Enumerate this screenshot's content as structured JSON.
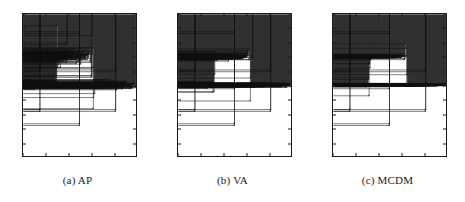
{
  "figure": {
    "background": "#ffffff",
    "ink": "#111111",
    "panel_count": 3
  },
  "panels": [
    {
      "id": "panel-ap",
      "caption": "(a) AP",
      "left": 0,
      "chart_index": 0
    },
    {
      "id": "panel-va",
      "caption": "(b) VA",
      "left": 155,
      "chart_index": 1
    },
    {
      "id": "panel-mcdm",
      "caption": "(c) MCDM",
      "left": 310,
      "chart_index": 2
    }
  ],
  "axis": {
    "x_ticks": [
      0,
      200,
      400,
      600,
      800,
      1000
    ],
    "x_tick_labels": [
      "0",
      "200",
      "400",
      "600",
      "800",
      "1000"
    ],
    "y_ticks": [
      0,
      100,
      200,
      300,
      400,
      500,
      600,
      700,
      800,
      900,
      1000
    ],
    "y_tick_labels": [
      "0",
      "100",
      "200",
      "300",
      "400",
      "500",
      "600",
      "700",
      "800",
      "900",
      "1000"
    ],
    "xlim": [
      0,
      1000
    ],
    "ylim": [
      0,
      1000
    ],
    "grid": false
  },
  "chart_data": [
    {
      "type": "scatter",
      "title": "(a) AP",
      "xlabel": "",
      "ylabel": "",
      "xlim": [
        0,
        1000
      ],
      "ylim": [
        0,
        1000
      ],
      "grid": false,
      "legend": "none",
      "marker": "plus",
      "color": "#111111",
      "noise_level": "high",
      "description": "Step-shaped signal: baseline near 500, elevated plateau near 700 between x=300 and x=620, with heavy scatter at the transitions plus isolated outlier markers.",
      "baseline_value": 500,
      "plateau_value": 700,
      "plateau_range": [
        300,
        620
      ],
      "series": [
        {
          "name": "signal",
          "noise_sigma_baseline": 14,
          "noise_sigma_plateau": 22,
          "noise_sigma_transition": 70,
          "points": 330
        }
      ],
      "outliers": [
        {
          "x": 150,
          "y": 600
        },
        {
          "x": 500,
          "y": 870
        },
        {
          "x": 820,
          "y": 600
        },
        {
          "x": 150,
          "y": 320
        },
        {
          "x": 500,
          "y": 220
        },
        {
          "x": 820,
          "y": 320
        },
        {
          "x": 500,
          "y": 480
        },
        {
          "x": 390,
          "y": 790
        },
        {
          "x": 610,
          "y": 560
        }
      ]
    },
    {
      "type": "scatter",
      "title": "(b) VA",
      "xlabel": "",
      "ylabel": "",
      "xlim": [
        0,
        1000
      ],
      "ylim": [
        0,
        1000
      ],
      "grid": false,
      "legend": "none",
      "marker": "plus",
      "color": "#111111",
      "noise_level": "medium",
      "description": "Step-shaped signal: baseline near 500, plateau near 700 between x=320 and x=640, moderate scatter concentrated at the rising and falling edges.",
      "baseline_value": 500,
      "plateau_value": 700,
      "plateau_range": [
        320,
        640
      ],
      "series": [
        {
          "name": "signal",
          "noise_sigma_baseline": 7,
          "noise_sigma_plateau": 10,
          "noise_sigma_transition": 46,
          "points": 330
        }
      ],
      "outliers": [
        {
          "x": 150,
          "y": 600
        },
        {
          "x": 500,
          "y": 870
        },
        {
          "x": 820,
          "y": 600
        },
        {
          "x": 150,
          "y": 320
        },
        {
          "x": 500,
          "y": 220
        },
        {
          "x": 820,
          "y": 320
        },
        {
          "x": 500,
          "y": 480
        },
        {
          "x": 660,
          "y": 700
        }
      ]
    },
    {
      "type": "scatter",
      "title": "(c) MCDM",
      "xlabel": "",
      "ylabel": "",
      "xlim": [
        0,
        1000
      ],
      "ylim": [
        0,
        1000
      ],
      "grid": false,
      "legend": "none",
      "marker": "plus",
      "color": "#111111",
      "noise_level": "low",
      "description": "Clean step-shaped signal: tight baseline near 500, sharp plateau near 700 between x=320 and x=650, minimal scatter and crisp transitions.",
      "baseline_value": 500,
      "plateau_value": 700,
      "plateau_range": [
        320,
        650
      ],
      "series": [
        {
          "name": "signal",
          "noise_sigma_baseline": 4,
          "noise_sigma_plateau": 6,
          "noise_sigma_transition": 14,
          "points": 330
        }
      ],
      "outliers": [
        {
          "x": 150,
          "y": 600
        },
        {
          "x": 500,
          "y": 870
        },
        {
          "x": 820,
          "y": 600
        },
        {
          "x": 150,
          "y": 320
        },
        {
          "x": 500,
          "y": 220
        },
        {
          "x": 820,
          "y": 320
        },
        {
          "x": 500,
          "y": 480
        }
      ]
    }
  ]
}
